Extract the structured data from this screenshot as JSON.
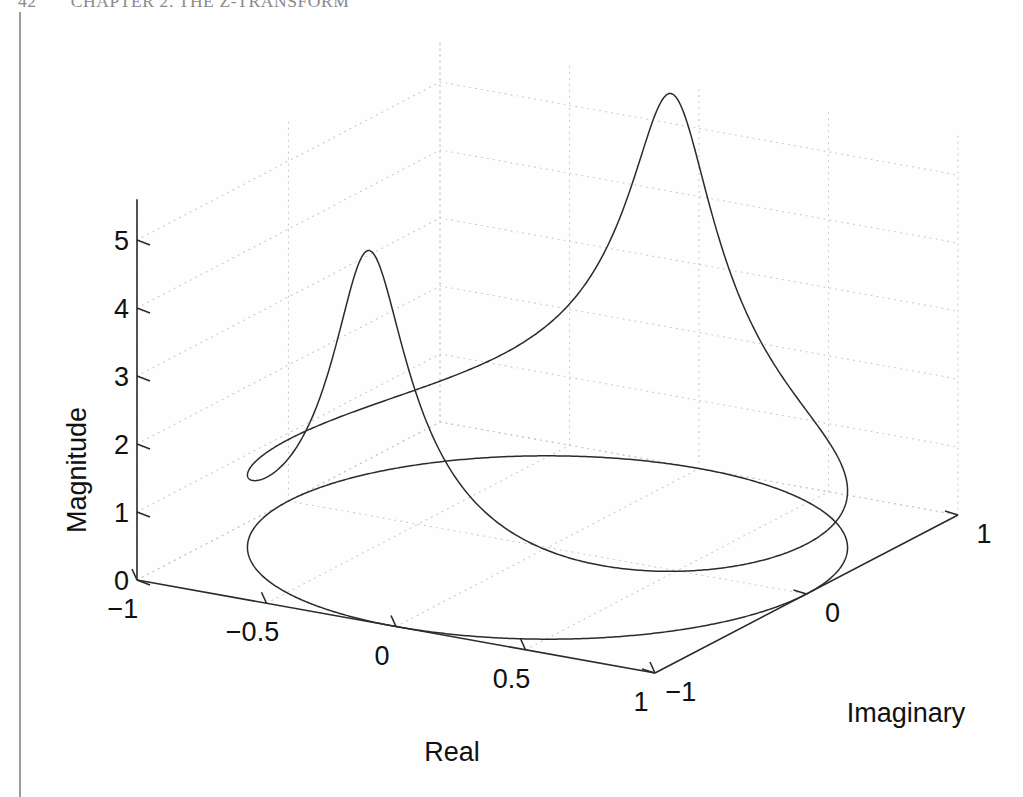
{
  "page": {
    "running_head": {
      "folio": "42",
      "chapter_title": "CHAPTER 2.  THE Z-TRANSFORM"
    }
  },
  "figure": {
    "axes": {
      "x": {
        "name": "Real",
        "label": "Real",
        "ticks": [
          -1,
          -0.5,
          0,
          0.5,
          1
        ],
        "tick_labels": [
          "−1",
          "−0.5",
          "0",
          "0.5",
          "1"
        ],
        "range": [
          -1,
          1
        ]
      },
      "y": {
        "name": "Imaginary",
        "label": "Imaginary",
        "ticks": [
          -1,
          0,
          1
        ],
        "tick_labels": [
          "−1",
          "0",
          "1"
        ],
        "range": [
          -1,
          1
        ]
      },
      "z": {
        "name": "Magnitude",
        "label": "Magnitude",
        "ticks": [
          0,
          1,
          2,
          3,
          4,
          5
        ],
        "tick_labels": [
          "0",
          "1",
          "2",
          "3",
          "4",
          "5"
        ],
        "range": [
          0,
          5.6
        ]
      }
    },
    "style": {
      "curve_color": "#2b2b2b",
      "axis_color": "#2b2b2b",
      "grid_color": "#c8c8c8",
      "background": "#ffffff",
      "grid": "dotted"
    }
  },
  "chart_data": {
    "type": "line",
    "title": "",
    "subtitle": "",
    "xlabel": "Real",
    "ylabel": "Imaginary",
    "zlabel": "Magnitude",
    "xlim": [
      -1,
      1
    ],
    "ylim": [
      -1,
      1
    ],
    "zlim": [
      0,
      5.6
    ],
    "grid": true,
    "legend": null,
    "projection": "3d",
    "view": {
      "azimuth_deg": -37.5,
      "elevation_deg": 30
    },
    "series": [
      {
        "name": "unit-circle-magnitude",
        "comment": "|H(e^{jω})| plotted at (cosω, sinω, |H|) for ω in [0,2π]",
        "peaks": [
          {
            "label": "near-peak",
            "real": -0.05,
            "imaginary": 1.0,
            "magnitude": 4.55
          },
          {
            "label": "far-peak",
            "real": -0.05,
            "imaginary": -1.0,
            "magnitude": 5.45
          }
        ],
        "minimum_magnitude": 0.62,
        "samples_omega": 721
      },
      {
        "name": "unit-circle-base",
        "comment": "projection of the evaluation contour onto the z-plane at magnitude 0",
        "radius": 1.0,
        "magnitude": 0.0
      }
    ],
    "model": {
      "kind": "two-pole-resonator",
      "pole_radius": 0.86,
      "pole_angle_deg": 96.0,
      "gain": 1.0
    },
    "tick_values": {
      "x": [
        -1,
        -0.5,
        0,
        0.5,
        1
      ],
      "y": [
        -1,
        0,
        1
      ],
      "z": [
        0,
        1,
        2,
        3,
        4,
        5
      ]
    }
  }
}
